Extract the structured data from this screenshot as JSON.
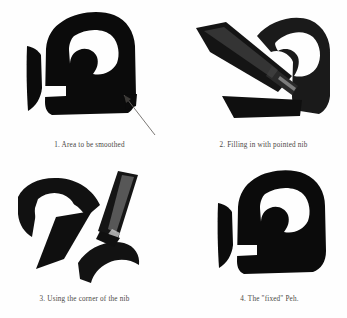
{
  "figure": {
    "background_color": "#fefefe",
    "ink_color": "#0b0b0b",
    "caption_color": "#4a4744",
    "letter": "Peh",
    "panel_count": 4
  },
  "panels": [
    {
      "number": "1",
      "caption": "1. Area to be smoothed",
      "content": "Hebrew letter Peh with an angular bottom-right corner, arrow indicating the rough area",
      "has_arrow": true,
      "has_nib": false
    },
    {
      "number": "2",
      "caption": "2. Filling in with pointed nib",
      "content": "Pen nib laid diagonally across the letter, filling in the corner",
      "has_arrow": false,
      "has_nib": true
    },
    {
      "number": "3",
      "caption": "3. Using the corner of the nib",
      "content": "Nib held upright, corner of the nib refining the stroke",
      "has_arrow": false,
      "has_nib": true
    },
    {
      "number": "4",
      "caption": "4. The \"fixed\" Peh.",
      "content": "Completed Hebrew letter Peh with a smoothed corner",
      "has_arrow": false,
      "has_nib": false
    }
  ]
}
